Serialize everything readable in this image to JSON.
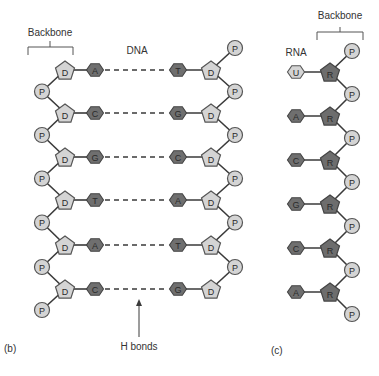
{
  "panels": {
    "dna": {
      "panel_label": "(b)",
      "title": "DNA",
      "backbone_label": "Backbone",
      "sugar_label": "D",
      "phosphate_label": "P",
      "hbond_label": "H bonds",
      "base_pairs": [
        {
          "left": "A",
          "right": "T"
        },
        {
          "left": "C",
          "right": "G"
        },
        {
          "left": "G",
          "right": "C"
        },
        {
          "left": "T",
          "right": "A"
        },
        {
          "left": "A",
          "right": "T"
        },
        {
          "left": "C",
          "right": "G"
        }
      ]
    },
    "rna": {
      "panel_label": "(c)",
      "title": "RNA",
      "backbone_label": "Backbone",
      "sugar_label": "R",
      "phosphate_label": "P",
      "bases": [
        "U",
        "A",
        "C",
        "G",
        "C",
        "A"
      ]
    }
  },
  "colors": {
    "light_fill": "#d4d4d4",
    "dark_fill": "#6d6d6d",
    "line": "#3a3a3a"
  }
}
